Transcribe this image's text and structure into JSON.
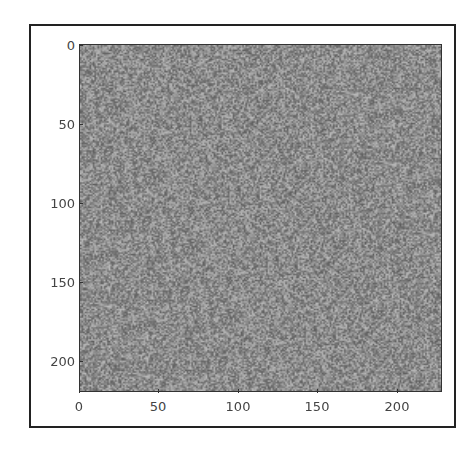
{
  "chart_data": {
    "type": "heatmap",
    "title": "",
    "xlabel": "",
    "ylabel": "",
    "image_size": [
      227,
      227
    ],
    "xlim": [
      0,
      227
    ],
    "ylim": [
      227,
      0
    ],
    "xticks": [
      "0",
      "50",
      "100",
      "150",
      "200"
    ],
    "yticks": [
      "0",
      "50",
      "100",
      "150",
      "200"
    ],
    "mean_color": "#8a8a8a",
    "grid": false
  },
  "axes": {
    "x_ticks": [
      {
        "label": "0",
        "pos": 79
      },
      {
        "label": "50",
        "pos": 158
      },
      {
        "label": "100",
        "pos": 238
      },
      {
        "label": "150",
        "pos": 317
      },
      {
        "label": "200",
        "pos": 397
      }
    ],
    "y_ticks": [
      {
        "label": "0",
        "pos": 45
      },
      {
        "label": "50",
        "pos": 124
      },
      {
        "label": "100",
        "pos": 203
      },
      {
        "label": "150",
        "pos": 282
      },
      {
        "label": "200",
        "pos": 361
      }
    ]
  }
}
